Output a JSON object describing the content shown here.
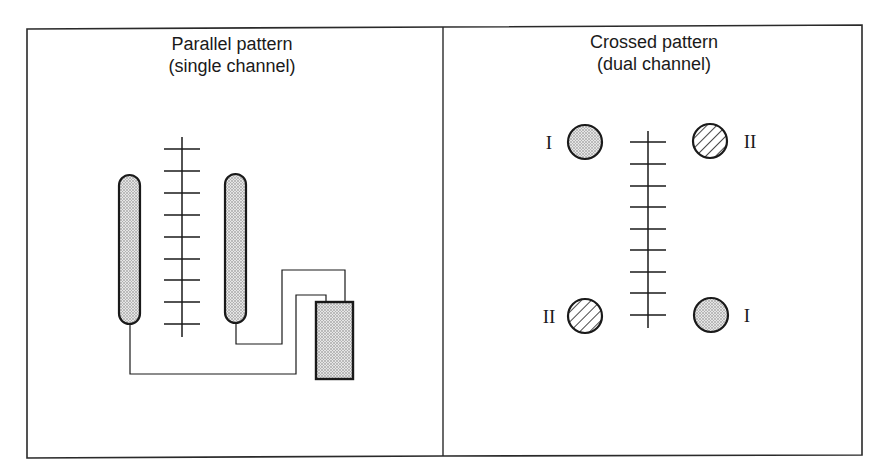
{
  "figure": {
    "panels": [
      {
        "id": "parallel",
        "title_line1": "Parallel pattern",
        "title_line2": "(single channel)",
        "elements": {
          "electrodes": [
            {
              "name": "left-electrode",
              "shape": "elongated-capsule",
              "fill": "stippled"
            },
            {
              "name": "right-electrode",
              "shape": "elongated-capsule",
              "fill": "stippled"
            }
          ],
          "incision_ladder": {
            "rungs": 9
          },
          "stimulator_unit": {
            "shape": "rectangle",
            "fill": "stippled"
          },
          "wires": 2
        }
      },
      {
        "id": "crossed",
        "title_line1": "Crossed pattern",
        "title_line2": "(dual channel)",
        "elements": {
          "electrodes": [
            {
              "name": "top-left-electrode",
              "channel_label": "I",
              "fill": "stippled"
            },
            {
              "name": "top-right-electrode",
              "channel_label": "II",
              "fill": "hatched"
            },
            {
              "name": "bottom-left-electrode",
              "channel_label": "II",
              "fill": "hatched"
            },
            {
              "name": "bottom-right-electrode",
              "channel_label": "I",
              "fill": "stippled"
            }
          ],
          "incision_ladder": {
            "rungs": 9
          }
        }
      }
    ],
    "colors": {
      "stroke": "#1a1a1a",
      "background": "#ffffff",
      "stipple_dot": "#7a7a7a",
      "stipple_bg": "#e6e6e6"
    }
  }
}
